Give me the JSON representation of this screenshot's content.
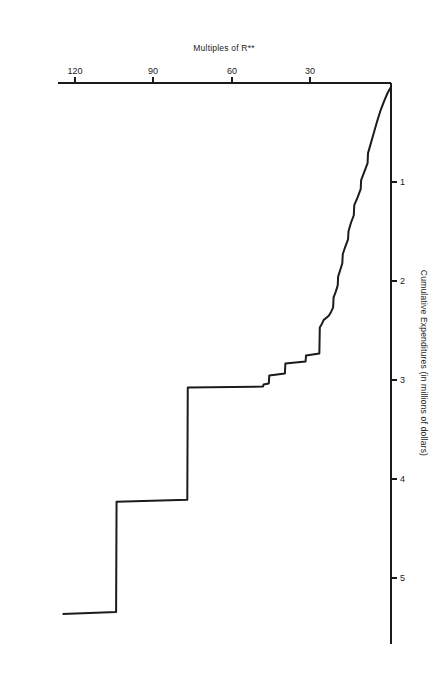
{
  "figure": {
    "background_color": "#ffffff",
    "ink_color": "#1b1b1b",
    "orientation_note": "printed upside down",
    "rotation_degrees": 180
  },
  "chart_data": {
    "type": "line",
    "title": "",
    "subtitle": "",
    "xlabel": "Multiples of R**",
    "ylabel": "Cumulative Expenditures (in millions of dollars)",
    "xlim": [
      0,
      145
    ],
    "ylim": [
      0,
      5.6
    ],
    "xticks": [
      30,
      60,
      90,
      120
    ],
    "xtick_labels": [
      "30",
      "60",
      "90",
      "120"
    ],
    "yticks": [
      1,
      2,
      3,
      4,
      5
    ],
    "ytick_labels": [
      "1",
      "2",
      "3",
      "4",
      "5"
    ],
    "grid": false,
    "legend": false,
    "legend_position": "none",
    "annotations": [],
    "series": [
      {
        "name": "Cumulative Expenditures",
        "style": "step-and-slope",
        "x": [
          0.0,
          1.5,
          3.0,
          4.5,
          6.0,
          7.5,
          9.0,
          10.0,
          10.2,
          11.5,
          13.0,
          13.2,
          14.5,
          16.0,
          16.2,
          17.5,
          18.5,
          18.7,
          20.0,
          21.0,
          21.2,
          22.0,
          23.0,
          23.2,
          24.0,
          25.0,
          25.2,
          26.0,
          27.0,
          29.0,
          29.2,
          30.0,
          31.0,
          31.2,
          37.0,
          37.2,
          46.0,
          46.2,
          53.0,
          53.2,
          55.5,
          55.7,
          88.5,
          88.7,
          119.5,
          119.7,
          143.0
        ],
        "y": [
          0.04,
          0.1,
          0.18,
          0.27,
          0.38,
          0.5,
          0.62,
          0.7,
          0.8,
          0.88,
          0.97,
          1.06,
          1.14,
          1.22,
          1.32,
          1.4,
          1.48,
          1.56,
          1.64,
          1.71,
          1.8,
          1.86,
          1.93,
          2.02,
          2.08,
          2.14,
          2.24,
          2.28,
          2.32,
          2.36,
          2.36,
          2.4,
          2.44,
          2.7,
          2.72,
          2.78,
          2.8,
          2.9,
          2.92,
          3.0,
          3.01,
          3.03,
          3.04,
          4.16,
          4.18,
          5.28,
          5.3
        ]
      }
    ]
  },
  "axes": {
    "x_axis_name": "multiples-of-r-axis",
    "y_axis_name": "cumulative-expenditures-axis"
  }
}
